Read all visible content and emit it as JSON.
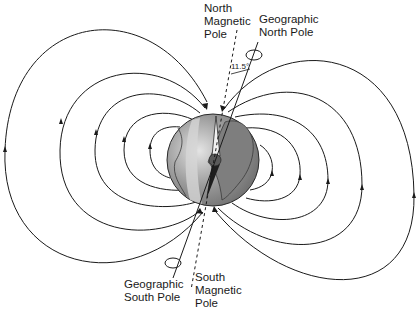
{
  "diagram": {
    "labels": {
      "north_magnetic_pole": "North\nMagnetic\nPole",
      "geographic_north_pole": "Geographic\nNorth Pole",
      "geographic_south_pole": "Geographic\nSouth Pole",
      "south_magnetic_pole": "South\nMagnetic\nPole",
      "tilt_angle": "11.5°"
    },
    "colors": {
      "ink": "#1a1a1a",
      "globe_ocean": "#8a8a8a",
      "globe_land": "#a0a0a0",
      "globe_highlight": "#d8d8d8"
    },
    "field_line_count_per_side": 5
  }
}
